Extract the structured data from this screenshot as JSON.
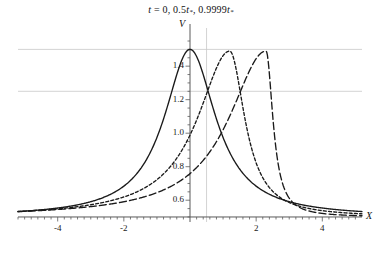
{
  "chart_data": {
    "type": "line",
    "title": "t = 0, 0.5t*, 0.9999t*",
    "title_parts": {
      "t_var": "t",
      "eq": " = 0, 0.5",
      "tstar1_base": "t",
      "tstar1_sub": "*",
      "mid": ", 0.9999",
      "tstar2_base": "t",
      "tstar2_sub": "*"
    },
    "xlabel": "X",
    "ylabel": "V",
    "xlim": [
      -5.2,
      5.2
    ],
    "ylim": [
      0.47,
      1.58
    ],
    "grid": true,
    "grid_color": "#c8c8c8",
    "axis_color": "#5a5a5a",
    "curve_color": "#1a1a1a",
    "legend_position": "none",
    "xticks": [
      -4,
      -2,
      2,
      4
    ],
    "xtick_labels": [
      "-4",
      "-2",
      "2",
      "4"
    ],
    "yticks": [
      0.6,
      0.8,
      1.0,
      1.2,
      1.4
    ],
    "ytick_labels": [
      "0.6",
      "0.8",
      "1.0",
      "1.2",
      "1.4"
    ],
    "hgridlines": [
      1.25,
      1.5
    ],
    "vgridlines": [
      0.5
    ],
    "x": [
      -5.2,
      -5.0,
      -4.5,
      -4.0,
      -3.5,
      -3.0,
      -2.5,
      -2.0,
      -1.5,
      -1.0,
      -0.5,
      0.0,
      0.5,
      1.0,
      1.5,
      2.0,
      2.5,
      3.0,
      3.5,
      4.0,
      4.5,
      5.0,
      5.2
    ],
    "series": [
      {
        "name": "t = 0",
        "style": "solid",
        "peak_x": 0.0,
        "peak_y": 1.5,
        "values": [
          0.515,
          0.519,
          0.531,
          0.547,
          0.57,
          0.602,
          0.65,
          0.724,
          0.84,
          1.015,
          1.265,
          1.5,
          1.265,
          1.015,
          0.84,
          0.724,
          0.65,
          0.602,
          0.57,
          0.547,
          0.531,
          0.519,
          0.515
        ]
      },
      {
        "name": "t = 0.5t*",
        "style": "short-dash",
        "peak_x": 1.2,
        "peak_y": 1.49,
        "values": [
          0.508,
          0.511,
          0.52,
          0.532,
          0.548,
          0.57,
          0.602,
          0.65,
          0.726,
          0.845,
          1.01,
          1.15,
          1.295,
          1.43,
          1.47,
          1.16,
          0.83,
          0.68,
          0.608,
          0.568,
          0.542,
          0.524,
          0.518
        ]
      },
      {
        "name": "t = 0.9999t*",
        "style": "long-dash",
        "peak_x": 2.3,
        "peak_y": 1.49,
        "values": [
          0.503,
          0.505,
          0.512,
          0.521,
          0.533,
          0.549,
          0.571,
          0.602,
          0.648,
          0.718,
          0.8,
          0.88,
          0.975,
          1.09,
          1.23,
          1.37,
          1.48,
          0.76,
          0.64,
          0.585,
          0.552,
          0.53,
          0.524
        ]
      }
    ]
  }
}
